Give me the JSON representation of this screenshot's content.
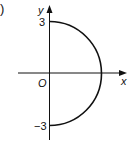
{
  "figure": {
    "part_label": ")",
    "axes": {
      "x_label": "x",
      "y_label": "y",
      "origin_label": "O"
    },
    "ticks": {
      "y_top": "3",
      "y_bottom": "−3"
    },
    "curve": {
      "type": "semicircle",
      "center": [
        0,
        0
      ],
      "radius": 3,
      "side": "right",
      "from": [
        0,
        3
      ],
      "to": [
        0,
        -3
      ]
    },
    "colors": {
      "stroke": "#111111",
      "background": "#ffffff"
    }
  }
}
